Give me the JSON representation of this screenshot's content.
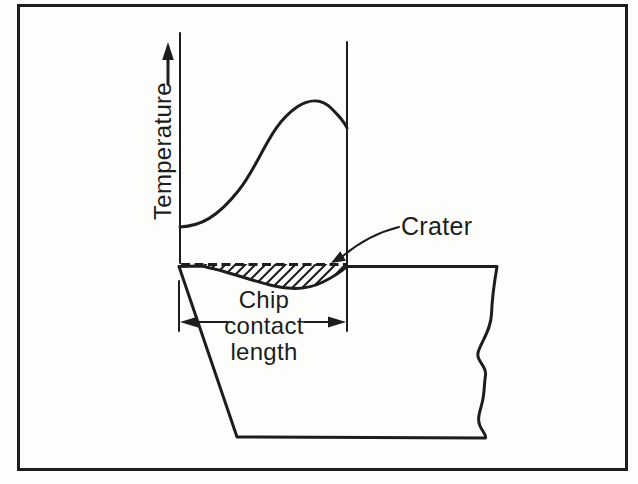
{
  "figure": {
    "type": "textbook-line-diagram",
    "background_color": "#fdfdfc",
    "ink_color": "#1d1d1d",
    "labels": {
      "temperature_axis": "Temperature",
      "crater": "Crater",
      "chip_contact_length_lines": [
        "Chip",
        "contact",
        "length"
      ]
    }
  }
}
